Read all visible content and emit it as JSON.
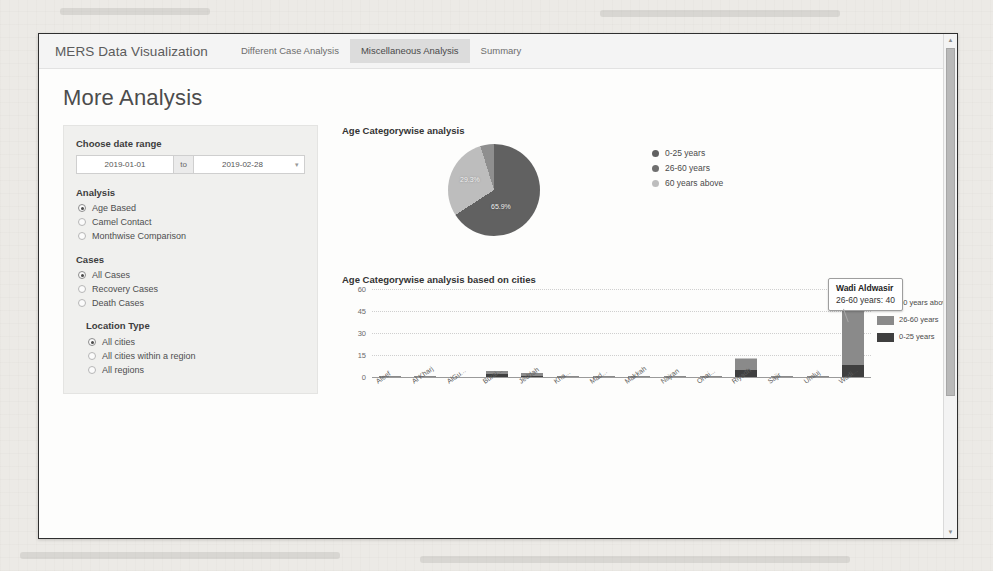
{
  "navbar": {
    "brand": "MERS Data Visualization",
    "tabs": [
      {
        "label": "Different Case Analysis",
        "active": false
      },
      {
        "label": "Miscellaneous Analysis",
        "active": true
      },
      {
        "label": "Summary",
        "active": false
      }
    ]
  },
  "page": {
    "title": "More Analysis"
  },
  "sidebar": {
    "date_range": {
      "label": "Choose date range",
      "start_value": "2019-01-01",
      "start_placeholder": "yyyy-mm-dd",
      "separator": "to",
      "end_value": "2019-02-28",
      "end_placeholder": "yyyy-mm-dd",
      "calendar_icon": "calendar-icon"
    },
    "analysis": {
      "label": "Analysis",
      "options": [
        {
          "label": "Age Based",
          "selected": true
        },
        {
          "label": "Camel Contact",
          "selected": false
        },
        {
          "label": "Monthwise Comparison",
          "selected": false
        }
      ]
    },
    "cases": {
      "label": "Cases",
      "options": [
        {
          "label": "All Cases",
          "selected": true
        },
        {
          "label": "Recovery Cases",
          "selected": false
        },
        {
          "label": "Death Cases",
          "selected": false
        }
      ]
    },
    "location_type": {
      "label": "Location Type",
      "options": [
        {
          "label": "All cities",
          "selected": true
        },
        {
          "label": "All cities within a region",
          "selected": false
        },
        {
          "label": "All regions",
          "selected": false
        }
      ]
    }
  },
  "colors": {
    "series_0_25": "#3f3f3f",
    "series_26_60": "#8a8a8a",
    "series_60_above": "#c4c4c4",
    "pie_0_25": "#616161",
    "pie_26_60": "#bdbdbd",
    "pie_60_above": "#8f8f8f",
    "tab_active_bg": "#dcdcdc",
    "panel_bg": "#f0f0ee"
  },
  "chart_data": [
    {
      "type": "pie",
      "title": "Age Categorywise analysis",
      "labels": [
        "0-25 years",
        "26-60 years",
        "60 years above"
      ],
      "values": [
        65.9,
        29.3,
        4.8
      ],
      "value_labels": [
        "65.9%",
        "29.3%",
        ""
      ],
      "legend": [
        "0-25 years",
        "26-60 years",
        "60 years above"
      ],
      "legend_position": "right",
      "grid": false
    },
    {
      "type": "bar",
      "title": "Age Categorywise analysis based on cities",
      "stacked": true,
      "xlabel": "",
      "ylabel": "",
      "ylim": [
        0,
        60
      ],
      "yticks": [
        0,
        15,
        30,
        45,
        60
      ],
      "grid": true,
      "legend_position": "right",
      "legend": [
        "60 years above",
        "26-60 years",
        "0-25 years"
      ],
      "categories": [
        "Afeef",
        "Al Kharj",
        "AlGu...",
        "Burai...",
        "Jeddah",
        "Kha...",
        "Mad...",
        "Makkah",
        "Najran",
        "Onai...",
        "Riyadh",
        "Sajir",
        "Umluj",
        "Wadi..."
      ],
      "series": [
        {
          "name": "0-25 years",
          "values": [
            0,
            0,
            0,
            2,
            1,
            0,
            0,
            0,
            0,
            0,
            5,
            0,
            0,
            8
          ]
        },
        {
          "name": "26-60 years",
          "values": [
            1,
            1,
            0,
            2,
            2,
            1,
            1,
            1,
            1,
            1,
            7,
            1,
            1,
            40
          ]
        },
        {
          "name": "60 years above",
          "values": [
            0,
            0,
            0,
            0,
            0,
            0,
            0,
            0,
            0,
            0,
            1,
            0,
            0,
            2
          ]
        }
      ],
      "tooltip": {
        "title": "Wadi Aldwasir",
        "series_name": "26-60 years",
        "value": "40",
        "text": "26-60 years: 40"
      }
    }
  ],
  "scrollbar": {
    "up_arrow": "triangle-up-icon",
    "down_arrow": "triangle-down-icon"
  }
}
